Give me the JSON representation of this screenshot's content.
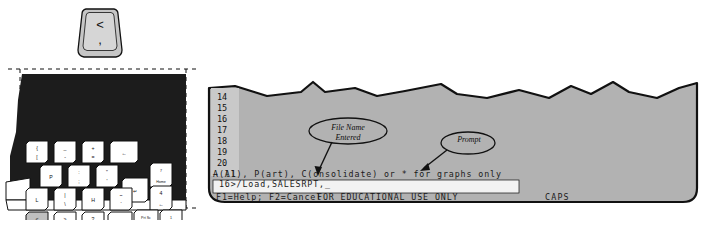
{
  "figure": {
    "caption": "Keyboard with comma key highlighted and a spreadsheet terminal screen showing a file-load prompt"
  },
  "keycap_callout": {
    "name": "comma-less-than-key",
    "top_legend": "<",
    "bottom_legend": ","
  },
  "keyboard": {
    "highlighted_key": {
      "top_legend": "<",
      "bottom_legend": ","
    },
    "keys": [
      {
        "id": "bracket-left",
        "top": "{",
        "bottom": "[",
        "x": 26,
        "y": 81,
        "w": 22,
        "h": 22
      },
      {
        "id": "minus",
        "top": "_",
        "bottom": "-",
        "x": 54,
        "y": 81,
        "w": 22,
        "h": 22
      },
      {
        "id": "equals",
        "top": "+",
        "bottom": "=",
        "x": 82,
        "y": 81,
        "w": 22,
        "h": 22
      },
      {
        "id": "backspace",
        "top": "←",
        "bottom": "",
        "x": 110,
        "y": 81,
        "w": 28,
        "h": 22
      },
      {
        "id": "p-key",
        "top": "P",
        "bottom": "",
        "x": 40,
        "y": 105,
        "w": 22,
        "h": 22
      },
      {
        "id": "semicolon",
        "top": ":",
        "bottom": ";",
        "x": 68,
        "y": 105,
        "w": 22,
        "h": 22
      },
      {
        "id": "quote",
        "top": "\"",
        "bottom": "'",
        "x": 96,
        "y": 105,
        "w": 22,
        "h": 22
      },
      {
        "id": "num-7-home",
        "top": "7",
        "bottom": "Home",
        "x": 150,
        "y": 103,
        "w": 22,
        "h": 24
      },
      {
        "id": "enter-key",
        "top": "↵",
        "bottom": "",
        "x": 122,
        "y": 118,
        "w": 26,
        "h": 24
      },
      {
        "id": "l-key",
        "top": "L",
        "bottom": "",
        "x": 26,
        "y": 128,
        "w": 22,
        "h": 22
      },
      {
        "id": "bar-key",
        "top": "|",
        "bottom": "\\",
        "x": 54,
        "y": 128,
        "w": 22,
        "h": 22
      },
      {
        "id": "h-key",
        "top": "H",
        "bottom": "",
        "x": 82,
        "y": 128,
        "w": 22,
        "h": 22
      },
      {
        "id": "tilde-key",
        "top": "~",
        "bottom": "`",
        "x": 110,
        "y": 128,
        "w": 22,
        "h": 22
      },
      {
        "id": "num-4-left",
        "top": "4",
        "bottom": "←",
        "x": 150,
        "y": 126,
        "w": 22,
        "h": 24
      },
      {
        "id": "comma-key",
        "top": "<",
        "bottom": ",",
        "x": 26,
        "y": 152,
        "w": 22,
        "h": 24,
        "highlight": true
      },
      {
        "id": "period-key",
        "top": ">",
        "bottom": ".",
        "x": 54,
        "y": 152,
        "w": 22,
        "h": 24
      },
      {
        "id": "slash-key",
        "top": "?",
        "bottom": "/",
        "x": 82,
        "y": 152,
        "w": 22,
        "h": 24
      },
      {
        "id": "shift-key",
        "top": "⇧",
        "bottom": "",
        "x": 108,
        "y": 152,
        "w": 24,
        "h": 24
      },
      {
        "id": "prtsc-key",
        "top": "Prt Sc",
        "bottom": "*",
        "x": 134,
        "y": 150,
        "w": 24,
        "h": 24
      },
      {
        "id": "num-1-end",
        "top": "1",
        "bottom": "End",
        "x": 160,
        "y": 150,
        "w": 22,
        "h": 24
      },
      {
        "id": "caps-lock",
        "top": "Caps",
        "bottom": "Lock",
        "x": 90,
        "y": 180,
        "w": 22,
        "h": 22
      },
      {
        "id": "num-0-ins",
        "top": "0",
        "bottom": "Ins",
        "x": 144,
        "y": 180,
        "w": 24,
        "h": 22
      }
    ]
  },
  "screen": {
    "row_numbers": [
      "14",
      "15",
      "16",
      "17",
      "18",
      "19",
      "20"
    ],
    "cell_pointer": "→ A1",
    "menu_line": "A(ll), P(art), C(onsolidate) or * for graphs only",
    "command_line": " 16>/Load,SALESRPT,_",
    "status_help": "F1=Help; F2=Cancel",
    "status_notice": "FOR EDUCATIONAL USE ONLY",
    "caps_indicator": "CAPS"
  },
  "annotations": {
    "filename": "File Name\nEntered",
    "prompt": "Prompt"
  },
  "colors": {
    "screen_fill": "#b2b2b2",
    "gutter_fill": "#c9c9c9",
    "status_fill": "#f2f2f2",
    "key_fill": "#ffffff",
    "key_highlight": "#bfbfbf",
    "keycap_fill": "#c6c6c6",
    "outline": "#111111"
  }
}
